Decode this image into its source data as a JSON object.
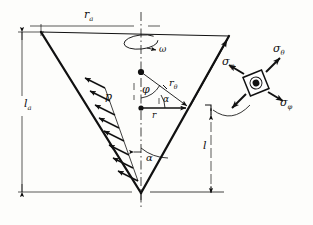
{
  "figure": {
    "kind": "engineering-diagram",
    "background_color": "#fdfdfb",
    "ink_color": "#111111"
  },
  "dimensions": {
    "top_radius": {
      "symbol": "r",
      "subscript": "a",
      "text": "r"
    },
    "left_length": {
      "symbol": "l",
      "subscript": "a",
      "text": "l"
    },
    "right_length": {
      "symbol": "l",
      "subscript": "",
      "text": "l"
    }
  },
  "annotations": {
    "angular_velocity": {
      "text": "ω",
      "name": "omega"
    },
    "pressure": {
      "text": "p",
      "name": "p"
    },
    "angle_phi": {
      "text": "φ",
      "name": "phi"
    },
    "angle_alpha_center": {
      "text": "α",
      "name": "alpha"
    },
    "angle_alpha_apex": {
      "text": "α",
      "name": "alpha"
    },
    "radius_theta": {
      "symbol": "r",
      "subscript": "θ",
      "text": "r"
    },
    "radius_r": {
      "symbol": "r",
      "subscript": "",
      "text": "r"
    }
  },
  "stresses": {
    "meridional_on_wall": {
      "symbol": "σ",
      "subscript": "φ",
      "text": "σ"
    },
    "hoop_on_element": {
      "symbol": "σ",
      "subscript": "θ",
      "text": "σ"
    },
    "meridional_on_element": {
      "symbol": "σ",
      "subscript": "φ",
      "text": "σ"
    }
  },
  "subscripts": {
    "a": "a",
    "theta": "θ",
    "phi": "φ",
    "none": ""
  }
}
